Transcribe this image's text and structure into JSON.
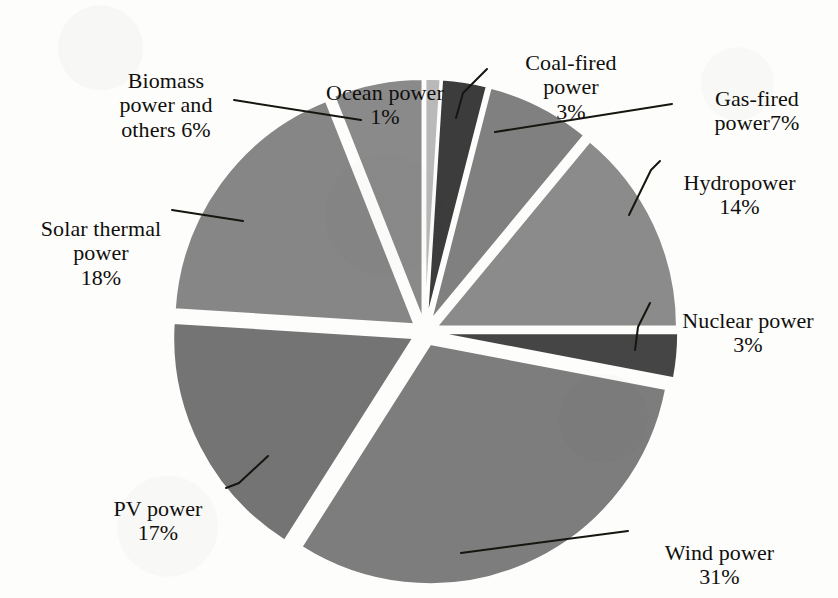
{
  "figure": {
    "background_color": "#fdfdfb",
    "text_color": "#100f0d",
    "gap_color": "#fdfdfb"
  },
  "chart_data": {
    "type": "pie",
    "title": "",
    "subtitle": "",
    "xlabel": "",
    "ylabel": "",
    "grid": false,
    "legend_position": "none",
    "label_format": "name + percent",
    "exploded": true,
    "units": "percent",
    "total": 100,
    "categories": [
      "Ocean power",
      "Coal-fired power",
      "Gas-fired power",
      "Hydropower",
      "Nuclear power",
      "Wind power",
      "PV power",
      "Solar thermal power",
      "Biomass power and others"
    ],
    "values": [
      1,
      3,
      7,
      14,
      3,
      31,
      17,
      18,
      6
    ],
    "slices": [
      {
        "name": "Ocean power",
        "value": 1,
        "percent_text": "1%",
        "color": "#b9b9b9",
        "start_deg": 0,
        "end_deg": 3.6,
        "explode": 0.055
      },
      {
        "name": "Coal-fired power",
        "value": 3,
        "percent_text": "3%",
        "color": "#3c3c3c",
        "start_deg": 3.6,
        "end_deg": 14.4,
        "explode": 0.055
      },
      {
        "name": "Gas-fired power",
        "value": 7,
        "percent_text": "7%",
        "color": "#808080",
        "start_deg": 14.4,
        "end_deg": 39.6,
        "explode": 0.055
      },
      {
        "name": "Hydropower",
        "value": 14,
        "percent_text": "14%",
        "color": "#8b8b8b",
        "start_deg": 39.6,
        "end_deg": 90.0,
        "explode": 0.055
      },
      {
        "name": "Nuclear power",
        "value": 3,
        "percent_text": "3%",
        "color": "#454545",
        "start_deg": 90.0,
        "end_deg": 100.8,
        "explode": 0.055
      },
      {
        "name": "Wind power",
        "value": 31,
        "percent_text": "31%",
        "color": "#7d7d7d",
        "start_deg": 100.8,
        "end_deg": 212.4,
        "explode": 0.055
      },
      {
        "name": "PV power",
        "value": 17,
        "percent_text": "17%",
        "color": "#747474",
        "start_deg": 212.4,
        "end_deg": 273.6,
        "explode": 0.055
      },
      {
        "name": "Solar thermal power",
        "value": 18,
        "percent_text": "18%",
        "color": "#868686",
        "start_deg": 273.6,
        "end_deg": 338.4,
        "explode": 0.055
      },
      {
        "name": "Biomass power and others",
        "value": 6,
        "percent_text": "6%",
        "color": "#8a8a8a",
        "start_deg": 338.4,
        "end_deg": 360.0,
        "explode": 0.055
      }
    ],
    "geometry": {
      "center_x": 425,
      "center_y": 332,
      "radius": 240
    }
  },
  "labels": {
    "biomass": {
      "name": "Biomass\npower and\nothers 6%",
      "x": 76,
      "y": 44,
      "w": 180
    },
    "ocean": {
      "name": "Ocean power\n1%",
      "x": 300,
      "y": 56,
      "w": 170
    },
    "coal": {
      "name": "Coal-fired\npower\n3%",
      "x": 496,
      "y": 26,
      "w": 150
    },
    "gas": {
      "name": "Gas-fired\npower7%",
      "x": 682,
      "y": 62,
      "w": 150
    },
    "hydro": {
      "name": "Hydropower\n14%",
      "x": 652,
      "y": 146,
      "w": 175
    },
    "nuclear": {
      "name": "Nuclear power\n3%",
      "x": 658,
      "y": 284,
      "w": 180
    },
    "wind": {
      "name": "Wind power\n31%",
      "x": 632,
      "y": 516,
      "w": 175
    },
    "pv": {
      "name": "PV power\n17%",
      "x": 78,
      "y": 472,
      "w": 160
    },
    "solar_thermal": {
      "name": "Solar thermal\npower\n18%",
      "x": 6,
      "y": 192,
      "w": 190
    }
  },
  "leader_lines": [
    {
      "name": "biomass-leader",
      "points": "234,100 361,120"
    },
    {
      "name": "coal-leader",
      "points": "487,69 463,93 456,118"
    },
    {
      "name": "gas-leader",
      "points": "672,104 495,132"
    },
    {
      "name": "hydro-leader",
      "points": "660,161 651,170 629,215"
    },
    {
      "name": "nuclear-leader",
      "points": "650,303 638,327 635,350"
    },
    {
      "name": "wind-leader",
      "points": "628,531 461,553"
    },
    {
      "name": "pv-leader",
      "points": "226,488 239,483 268,456"
    },
    {
      "name": "solar-leader",
      "points": "172,210 243,221"
    }
  ]
}
